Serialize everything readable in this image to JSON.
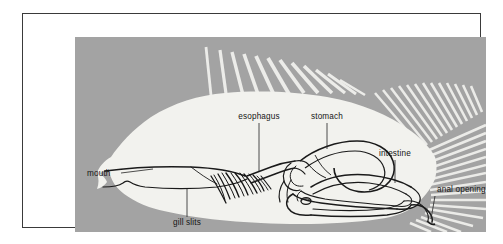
{
  "figure": {
    "view": "lateral cutaway",
    "panel_color": "#a3a3a3",
    "body_color": "#f2f2ee",
    "outline_color": "#1a1a1a",
    "frame_color": "#3a3a3a",
    "mat_color": "#ffffff"
  },
  "labels": [
    {
      "id": "mouth",
      "text": "mouth",
      "x": 12,
      "y": 139,
      "anchor": "start"
    },
    {
      "id": "gill-slits",
      "text": "gill slits",
      "x": 112,
      "y": 186,
      "anchor": "middle"
    },
    {
      "id": "esophagus",
      "text": "esophagus",
      "x": 172,
      "y": 82,
      "anchor": "middle"
    },
    {
      "id": "stomach",
      "text": "stomach",
      "x": 257,
      "y": 82,
      "anchor": "middle"
    },
    {
      "id": "intestine",
      "text": "intestine",
      "x": 327,
      "y": 119,
      "anchor": "middle"
    },
    {
      "id": "anal-opening",
      "text": "anal opening",
      "x": 364,
      "y": 155,
      "anchor": "start"
    }
  ],
  "anatomy_parts": [
    "mouth",
    "gill slits",
    "esophagus",
    "stomach",
    "intestine",
    "anal opening"
  ],
  "fin_groups": [
    {
      "name": "dorsal-spiny-rays",
      "count": 10
    },
    {
      "name": "dorsal-soft-rays",
      "count": 13
    },
    {
      "name": "caudal-fin-rays",
      "count": 16
    }
  ]
}
